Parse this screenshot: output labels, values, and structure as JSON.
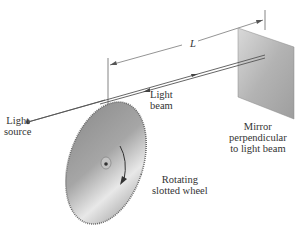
{
  "diagram": {
    "labels": {
      "distance": "L",
      "light_beam": [
        "Light",
        "beam"
      ],
      "light_source": [
        "Light",
        "source"
      ],
      "mirror": [
        "Mirror",
        "perpendicular",
        "to light beam"
      ],
      "wheel": [
        "Rotating",
        "slotted wheel"
      ]
    },
    "colors": {
      "line": "#555555",
      "wheel_fill": "#9a9a9a",
      "mirror_fill": "#b5b5b5",
      "text": "#333333"
    }
  }
}
